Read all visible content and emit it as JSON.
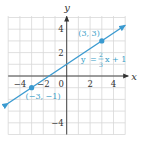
{
  "chart_data": {
    "type": "line",
    "title": "",
    "xlabel": "x",
    "ylabel": "y",
    "xlim": [
      -5,
      5
    ],
    "ylim": [
      -5,
      5
    ],
    "grid": true,
    "x_ticks": [
      -4,
      -2,
      0,
      2,
      4
    ],
    "y_ticks": [
      4,
      2,
      -4
    ],
    "x_tick_labels": [
      "−4",
      "−2",
      "0",
      "2",
      "4"
    ],
    "y_tick_labels": [
      "4",
      "2",
      "−4"
    ],
    "series": [
      {
        "name": "y = (2/3)x + 1",
        "equation": {
          "y": "y",
          "eq": "=",
          "num": "2",
          "den": "3",
          "rest": "x + 1"
        },
        "slope": 0.6667,
        "intercept": 1,
        "x": [
          -5,
          5
        ],
        "y": [
          -2.333,
          4.333
        ],
        "color": "#3a9ad0"
      }
    ],
    "points": [
      {
        "x": 3,
        "y": 3,
        "label": "(3, 3)"
      },
      {
        "x": -3,
        "y": -1,
        "label": "(−3, −1)"
      }
    ],
    "colors": {
      "line": "#3a9ad0",
      "label": "#3aa0c8",
      "grid": "#d8d8d8",
      "axis": "#333333"
    }
  }
}
